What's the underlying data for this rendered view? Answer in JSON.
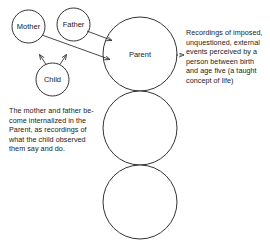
{
  "diagram": {
    "background_color": "#ffffff",
    "stroke_color": "#333333",
    "nodes": {
      "mother": {
        "label": "Mother",
        "cx": 28.5,
        "cy": 26.5,
        "r": 16.5
      },
      "father": {
        "label": "Father",
        "cx": 73.5,
        "cy": 24.5,
        "r": 16.5
      },
      "child": {
        "label": "Child",
        "cx": 52.5,
        "cy": 79.5,
        "r": 16.5
      },
      "parent": {
        "label": "Parent",
        "cx": 140,
        "cy": 54,
        "r": 37
      },
      "adult": {
        "label": "",
        "cx": 140,
        "cy": 128,
        "r": 37
      },
      "child_state": {
        "label": "",
        "cx": 140,
        "cy": 202,
        "r": 37
      }
    },
    "annotations": {
      "right": "Recordings of imposed,\nunquestioned, external\nevents perceived by a\nperson between birth\nand age five (a taught\nconcept of life)",
      "left": "The mother and father be-\ncome internalized in the\nParent, as recordings of\nwhat the child observed\nthem say and do."
    },
    "connectors": [
      {
        "name": "mother-to-parent",
        "style": "solid-arrow"
      },
      {
        "name": "father-to-parent",
        "style": "solid-arrow"
      },
      {
        "name": "child-to-mother",
        "style": "solid-arrow"
      },
      {
        "name": "child-to-father",
        "style": "solid-arrow"
      },
      {
        "name": "parent-to-annotation",
        "style": "dashed-arrow"
      }
    ]
  }
}
